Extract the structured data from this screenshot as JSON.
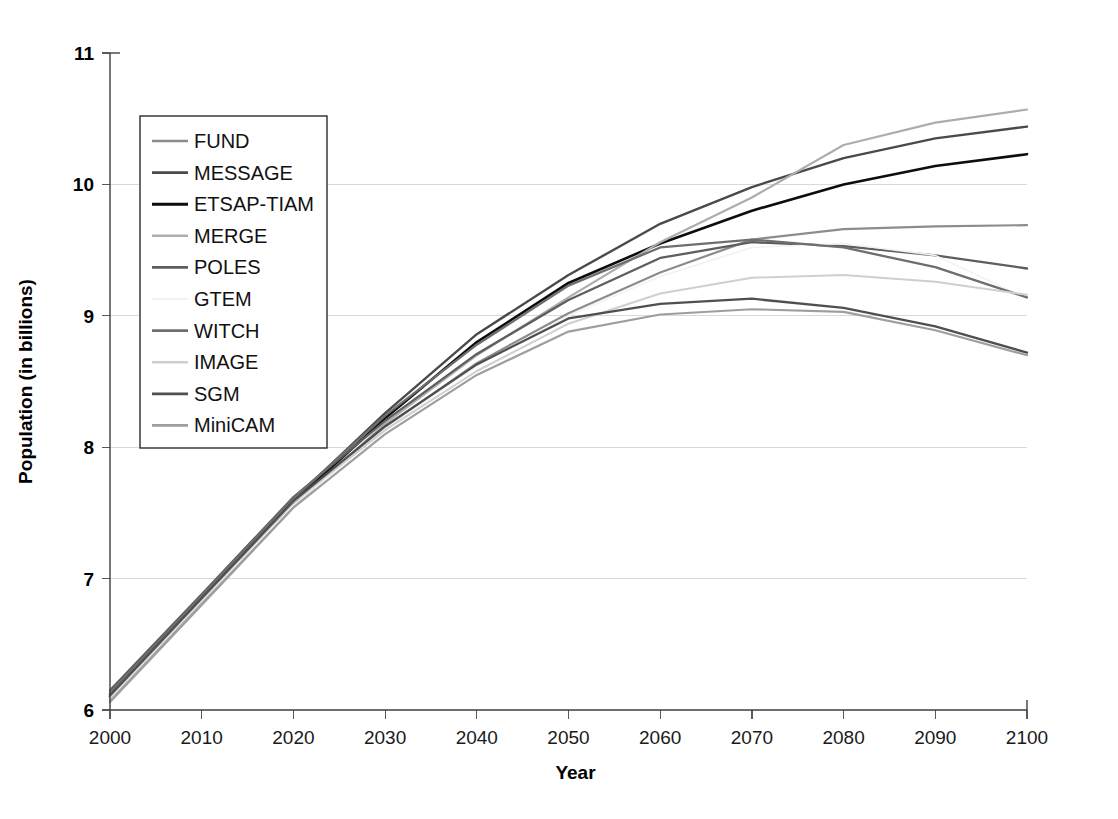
{
  "chart_data": {
    "type": "line",
    "title": "",
    "xlabel": "Year",
    "ylabel": "Population (in billions)",
    "x": [
      2000,
      2010,
      2020,
      2030,
      2040,
      2050,
      2060,
      2070,
      2080,
      2090,
      2100
    ],
    "xlim": [
      2000,
      2100
    ],
    "ylim": [
      6,
      11
    ],
    "xticks": [
      "2000",
      "2010",
      "2020",
      "2030",
      "2040",
      "2050",
      "2060",
      "2070",
      "2080",
      "2090",
      "2100"
    ],
    "yticks": [
      "6",
      "7",
      "8",
      "9",
      "10",
      "11"
    ],
    "grid": "horizontal",
    "legend_position": "upper-left-inside",
    "series": [
      {
        "name": "FUND",
        "color": "#8c8c8c",
        "width": 2.2,
        "values": [
          6.08,
          6.82,
          7.57,
          8.15,
          8.64,
          9.02,
          9.33,
          9.58,
          9.66,
          9.68,
          9.69
        ]
      },
      {
        "name": "MESSAGE",
        "color": "#4a4a4a",
        "width": 2.4,
        "values": [
          6.12,
          6.86,
          7.6,
          8.26,
          8.86,
          9.31,
          9.7,
          9.98,
          10.2,
          10.35,
          10.44
        ]
      },
      {
        "name": "ETSAP-TIAM",
        "color": "#0d0d0d",
        "width": 2.6,
        "values": [
          6.1,
          6.84,
          7.58,
          8.22,
          8.8,
          9.25,
          9.55,
          9.8,
          10.0,
          10.14,
          10.23
        ]
      },
      {
        "name": "MERGE",
        "color": "#adadad",
        "width": 2.2,
        "values": [
          6.07,
          6.81,
          7.55,
          8.18,
          8.7,
          9.14,
          9.56,
          9.9,
          10.3,
          10.47,
          10.57
        ]
      },
      {
        "name": "POLES",
        "color": "#5e5e5e",
        "width": 2.3,
        "values": [
          6.15,
          6.88,
          7.62,
          8.2,
          8.71,
          9.12,
          9.44,
          9.56,
          9.53,
          9.46,
          9.36
        ]
      },
      {
        "name": "GTEM",
        "color": "#f2f2f2",
        "width": 1.6,
        "values": [
          6.09,
          6.83,
          7.56,
          8.14,
          8.62,
          9.0,
          9.3,
          9.52,
          9.55,
          9.46,
          9.13
        ]
      },
      {
        "name": "WITCH",
        "color": "#6e6e6e",
        "width": 2.3,
        "values": [
          6.13,
          6.87,
          7.61,
          8.24,
          8.78,
          9.23,
          9.52,
          9.58,
          9.52,
          9.37,
          9.14
        ]
      },
      {
        "name": "IMAGE",
        "color": "#cfcfcf",
        "width": 2.0,
        "values": [
          6.1,
          6.84,
          7.58,
          8.13,
          8.58,
          8.94,
          9.17,
          9.29,
          9.31,
          9.26,
          9.16
        ]
      },
      {
        "name": "SGM",
        "color": "#4f4f4f",
        "width": 2.3,
        "values": [
          6.11,
          6.85,
          7.59,
          8.16,
          8.63,
          8.98,
          9.09,
          9.13,
          9.06,
          8.92,
          8.72
        ]
      },
      {
        "name": "MiniCAM",
        "color": "#9e9e9e",
        "width": 2.2,
        "values": [
          6.06,
          6.8,
          7.54,
          8.1,
          8.55,
          8.88,
          9.01,
          9.05,
          9.03,
          8.89,
          8.7
        ]
      }
    ]
  }
}
